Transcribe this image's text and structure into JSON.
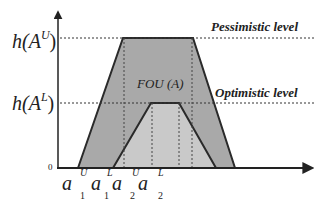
{
  "diagram": {
    "type": "interval type-2 fuzzy set (trapezoidal FOU)",
    "y_labels": {
      "upper_height": "h(A",
      "upper_height_sup": "U",
      "lower_height": "h(A",
      "lower_height_sup": "L",
      "close_paren": ")",
      "zero": "0"
    },
    "annotations": {
      "pessimistic": "Pessimistic level",
      "optimistic": "Optimistic level",
      "fou": "FOU (A)"
    },
    "x_labels": [
      {
        "base": "a",
        "sup": "U",
        "sub": "1"
      },
      {
        "base": "a",
        "sup": "L",
        "sub": "1"
      },
      {
        "base": "a",
        "sup": "U",
        "sub": "2"
      },
      {
        "base": "a",
        "sup": "L",
        "sub": "2"
      }
    ],
    "colors": {
      "upper_fill": "#a9a9a9",
      "lower_fill": "#cacaca",
      "stroke": "#2a2a2a"
    }
  }
}
